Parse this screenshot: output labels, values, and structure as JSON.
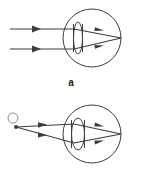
{
  "figure": {
    "background_color": "#ffffff",
    "stroke_color": "#3c3c42",
    "label_color": "#1a1a1a",
    "width": 142,
    "height": 196
  },
  "panels": [
    {
      "id": "a",
      "label": "a",
      "caption": "Distant object: parallel rays focused by a flattened lens onto the retina",
      "eye": {
        "name": "eyeball-circle",
        "center_x": 92,
        "center_y": 38,
        "radius": 29
      },
      "lens": {
        "name": "eye-lens-flat",
        "center_x": 78,
        "center_y": 38,
        "rx": 4.5,
        "ry": 16
      },
      "focus_point": {
        "x": 121,
        "y": 38
      },
      "rays": [
        {
          "name": "incoming-ray-upper",
          "start_x": 10,
          "y": 29,
          "arrow_x": 38
        },
        {
          "name": "incoming-ray-lower",
          "start_x": 10,
          "y": 49,
          "arrow_x": 38
        }
      ],
      "refracted_arrows": [
        {
          "name": "refracted-arrow-upper",
          "x": 101,
          "y": 31
        },
        {
          "name": "refracted-arrow-lower",
          "x": 101,
          "y": 45
        }
      ]
    },
    {
      "id": "b",
      "label": "b",
      "caption": "Near object: diverging rays focused by a rounded lens onto the retina",
      "eye": {
        "name": "eyeball-circle",
        "center_x": 92,
        "center_y": 134,
        "radius": 29
      },
      "lens": {
        "name": "eye-lens-rounded",
        "center_x": 78,
        "center_y": 134,
        "rx": 6.5,
        "ry": 16
      },
      "focus_point": {
        "x": 121,
        "y": 134
      },
      "object": {
        "name": "object-circle",
        "circle_x": 13,
        "circle_y": 118,
        "circle_r": 5,
        "source_x": 16,
        "source_y": 127,
        "dot_r": 2
      },
      "rays": [
        {
          "name": "object-ray-upper",
          "end_x": 74,
          "end_y": 124,
          "arrow_x": 47
        },
        {
          "name": "object-ray-lower",
          "end_x": 74,
          "end_y": 143,
          "arrow_x": 47
        }
      ],
      "refracted_arrows": [
        {
          "name": "refracted-arrow-upper",
          "x": 101,
          "y": 127
        },
        {
          "name": "refracted-arrow-lower",
          "x": 101,
          "y": 141
        }
      ]
    }
  ],
  "labels": {
    "a": "a",
    "b": "b"
  }
}
